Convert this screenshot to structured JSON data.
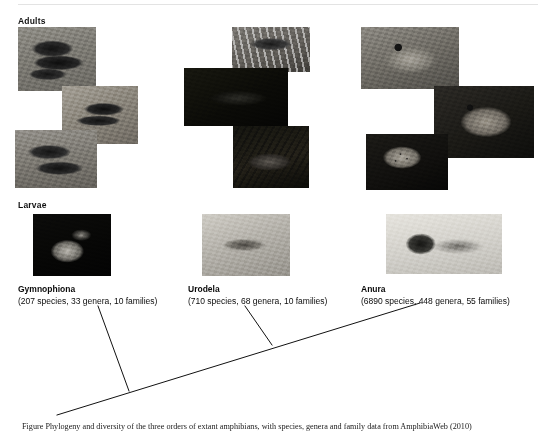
{
  "figure": {
    "row_labels": {
      "adults": "Adults",
      "larvae": "Larvae"
    },
    "taxa": [
      {
        "id": "gymnophiona",
        "name": "Gymnophiona",
        "counts": "(207 species, 33 genera, 10 families)",
        "species": 207,
        "genera": 33,
        "families": 10,
        "adult_photos": [
          "caecilian-coiled-dark",
          "caecilian-on-gravel",
          "caecilian-glossy-loop"
        ],
        "larva_photo": "caecilian-larva-dark-field"
      },
      {
        "id": "urodela",
        "name": "Urodela",
        "counts": "(710 species, 68 genera, 10 families)",
        "species": 710,
        "genera": 68,
        "families": 10,
        "adult_photos": [
          "spotted-salamander-on-rock",
          "salamander-dark-background",
          "crested-newt-on-sand"
        ],
        "larva_photo": "salamander-larva-with-gills"
      },
      {
        "id": "anura",
        "name": "Anura",
        "counts": "(6890 species, 448 genera, 55 families)",
        "species": 6890,
        "genera": 448,
        "families": 55,
        "adult_photos": [
          "tree-frog-climbing",
          "toad-on-sand",
          "spotted-frog-on-rock"
        ],
        "larva_photo": "tadpole-side-view"
      }
    ],
    "caption": "Figure   Phylogeny and diversity of the three orders of extant amphibians, with species, genera and family data from AmphibiaWeb (2010)",
    "tree": {
      "type": "cladogram",
      "line_color": "#111111",
      "line_width": 1,
      "root": {
        "x": 57,
        "y": 415
      },
      "spine_end": {
        "x": 420,
        "y": 303
      },
      "nodes": [
        {
          "taxon": "gymnophiona",
          "tip": {
            "x": 98,
            "y": 306
          },
          "junction": {
            "x": 129,
            "y": 391
          }
        },
        {
          "taxon": "urodela",
          "tip": {
            "x": 245,
            "y": 306
          },
          "junction": {
            "x": 272,
            "y": 345
          }
        },
        {
          "taxon": "anura",
          "tip": {
            "x": 420,
            "y": 303
          },
          "junction": {
            "x": 420,
            "y": 303
          }
        }
      ]
    },
    "colors": {
      "background": "#ffffff",
      "text": "#0b0b0b",
      "rule": "#e3e3e3",
      "tree_line": "#111111"
    }
  }
}
